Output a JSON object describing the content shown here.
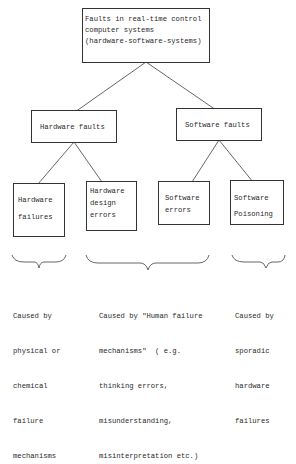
{
  "root": {
    "lines": [
      "Faults in real-time control",
      "computer systems",
      "(hardware-software-systems)"
    ]
  },
  "level1": [
    {
      "label": "Hardware faults"
    },
    {
      "label": "Software faults"
    }
  ],
  "level2": [
    {
      "lines": [
        "Hardware",
        "failures"
      ]
    },
    {
      "lines": [
        "Hardware",
        "design",
        "errors"
      ]
    },
    {
      "lines": [
        "Software",
        "errors"
      ]
    },
    {
      "lines": [
        "Software",
        "Poisoning"
      ]
    }
  ],
  "causes": [
    {
      "lines": [
        "Caused by",
        "physical or",
        "chemical",
        "failure",
        "mechanisms"
      ]
    },
    {
      "lines": [
        "Caused by \"Human failure",
        "mechanisms\"  ( e.g.",
        "thinking errors,",
        "misunderstanding,",
        "misinterpretation etc.)"
      ]
    },
    {
      "lines": [
        "Caused by",
        "sporadic",
        "hardware",
        "failures"
      ]
    }
  ]
}
